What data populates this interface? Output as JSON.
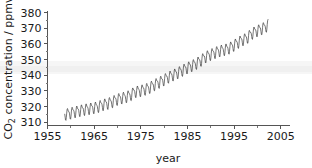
{
  "chart_data": {
    "type": "line",
    "title": "",
    "xlabel": "year",
    "ylabel": "CO2 concentration / ppmv",
    "ylabel_base": "CO",
    "ylabel_sub": "2",
    "ylabel_rest": " concentration / ppmv",
    "xlim": [
      1955,
      2007
    ],
    "ylim": [
      308,
      381
    ],
    "grid": false,
    "legend": "none",
    "x_major_ticks": [
      1955,
      1965,
      1975,
      1985,
      1995,
      2005
    ],
    "x_major_tick_labels": [
      "1955",
      "1965",
      "1975",
      "1985",
      "1995",
      "2005"
    ],
    "x_minor_ticks": [
      1960,
      1970,
      1980,
      1990,
      2000
    ],
    "y_major_ticks": [
      310,
      320,
      330,
      340,
      350,
      360,
      370,
      380
    ],
    "y_major_tick_labels": [
      "310",
      "320",
      "330",
      "340",
      "350",
      "360",
      "370",
      "380"
    ],
    "y_minor_ticks": [
      315,
      325,
      335,
      345,
      355,
      365,
      375
    ],
    "series_name": "Mauna Loa monthly mean CO2",
    "seasonal_amplitude_ppmv": 3.1,
    "x_start": 1958.7,
    "x_end": 2002.3,
    "line_color": "#2b2b2b",
    "annual_trend": [
      {
        "year": 1958.7,
        "value": 315.2
      },
      {
        "year": 1959.7,
        "value": 315.9
      },
      {
        "year": 1960.7,
        "value": 316.8
      },
      {
        "year": 1961.7,
        "value": 317.5
      },
      {
        "year": 1962.7,
        "value": 318.3
      },
      {
        "year": 1963.7,
        "value": 318.8
      },
      {
        "year": 1964.7,
        "value": 319.4
      },
      {
        "year": 1965.7,
        "value": 320.0
      },
      {
        "year": 1966.7,
        "value": 321.3
      },
      {
        "year": 1967.7,
        "value": 322.1
      },
      {
        "year": 1968.7,
        "value": 323.0
      },
      {
        "year": 1969.7,
        "value": 324.6
      },
      {
        "year": 1970.7,
        "value": 325.6
      },
      {
        "year": 1971.7,
        "value": 326.3
      },
      {
        "year": 1972.7,
        "value": 327.4
      },
      {
        "year": 1973.7,
        "value": 329.7
      },
      {
        "year": 1974.7,
        "value": 330.2
      },
      {
        "year": 1975.7,
        "value": 331.1
      },
      {
        "year": 1976.7,
        "value": 332.0
      },
      {
        "year": 1977.7,
        "value": 333.8
      },
      {
        "year": 1978.7,
        "value": 335.4
      },
      {
        "year": 1979.7,
        "value": 336.8
      },
      {
        "year": 1980.7,
        "value": 338.7
      },
      {
        "year": 1981.7,
        "value": 340.1
      },
      {
        "year": 1982.7,
        "value": 341.4
      },
      {
        "year": 1983.7,
        "value": 343.0
      },
      {
        "year": 1984.7,
        "value": 344.6
      },
      {
        "year": 1985.7,
        "value": 346.0
      },
      {
        "year": 1986.7,
        "value": 347.4
      },
      {
        "year": 1987.7,
        "value": 349.2
      },
      {
        "year": 1988.7,
        "value": 351.6
      },
      {
        "year": 1989.7,
        "value": 353.1
      },
      {
        "year": 1990.7,
        "value": 354.4
      },
      {
        "year": 1991.7,
        "value": 355.6
      },
      {
        "year": 1992.7,
        "value": 356.4
      },
      {
        "year": 1993.7,
        "value": 357.1
      },
      {
        "year": 1994.7,
        "value": 358.8
      },
      {
        "year": 1995.7,
        "value": 360.8
      },
      {
        "year": 1996.7,
        "value": 362.6
      },
      {
        "year": 1997.7,
        "value": 363.8
      },
      {
        "year": 1998.7,
        "value": 366.6
      },
      {
        "year": 1999.7,
        "value": 368.3
      },
      {
        "year": 2000.7,
        "value": 369.5
      },
      {
        "year": 2001.7,
        "value": 371.0
      },
      {
        "year": 2002.3,
        "value": 372.4
      }
    ]
  }
}
